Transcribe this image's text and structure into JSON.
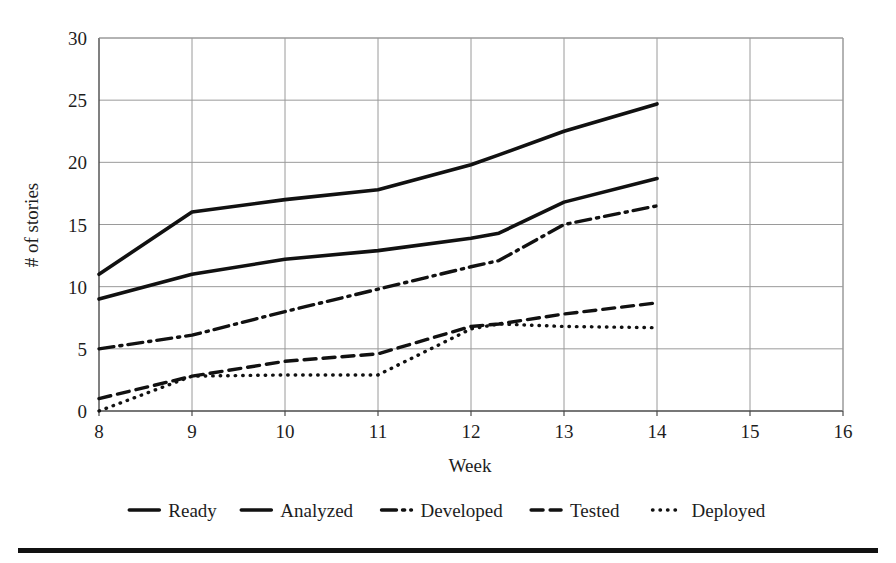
{
  "chart_data": {
    "type": "line",
    "title": "",
    "xlabel": "Week",
    "ylabel": "# of stories",
    "xlim": [
      8,
      16
    ],
    "ylim": [
      0,
      30
    ],
    "xticks": [
      "8",
      "9",
      "10",
      "11",
      "12",
      "13",
      "14",
      "15",
      "16"
    ],
    "yticks": [
      "0",
      "5",
      "10",
      "15",
      "20",
      "25",
      "30"
    ],
    "grid": true,
    "legend_position": "bottom",
    "x": [
      8,
      9,
      10,
      11,
      12,
      12.3,
      13,
      14
    ],
    "series": [
      {
        "name": "Ready",
        "style": "solid-thick",
        "values": [
          11.0,
          16.0,
          17.0,
          17.8,
          19.8,
          20.6,
          22.5,
          24.7
        ]
      },
      {
        "name": "Analyzed",
        "style": "solid-thick",
        "values": [
          9.0,
          11.0,
          12.2,
          12.9,
          13.9,
          14.3,
          16.8,
          18.7
        ]
      },
      {
        "name": "Developed",
        "style": "dash-dot",
        "values": [
          5.0,
          6.1,
          8.0,
          9.8,
          11.6,
          12.1,
          15.0,
          16.5
        ]
      },
      {
        "name": "Tested",
        "style": "dashed",
        "values": [
          1.0,
          2.8,
          4.0,
          4.6,
          6.8,
          7.0,
          7.8,
          8.7
        ]
      },
      {
        "name": "Deployed",
        "style": "dotted",
        "values": [
          0.0,
          2.8,
          2.9,
          2.9,
          6.6,
          7.0,
          6.8,
          6.7
        ]
      }
    ]
  },
  "legend": {
    "items": [
      {
        "label": "Ready",
        "style": "solid-thick"
      },
      {
        "label": "Analyzed",
        "style": "solid-thick"
      },
      {
        "label": "Developed",
        "style": "dash-dot"
      },
      {
        "label": "Tested",
        "style": "dashed"
      },
      {
        "label": "Deployed",
        "style": "dotted"
      }
    ]
  },
  "colors": {
    "ink": "#111111",
    "grid": "#9a9a9a",
    "axis": "#555555",
    "rule": "#111111",
    "background": "#ffffff"
  }
}
